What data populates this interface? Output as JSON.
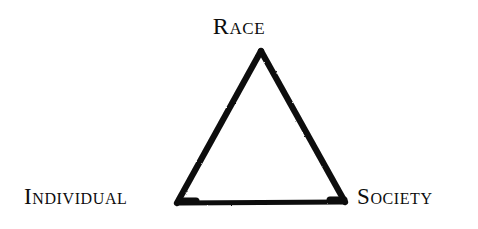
{
  "figure": {
    "type": "triangle-relationship-diagram",
    "background_color": "#ffffff",
    "stroke_color": "#0d0d0d",
    "width": 478,
    "height": 229
  },
  "diagram": {
    "shape": "triangle",
    "vertices": [
      {
        "id": "apex",
        "label": "Race",
        "x": 261,
        "y": 51
      },
      {
        "id": "bottom-left",
        "label": "Individual",
        "x": 177,
        "y": 203
      },
      {
        "id": "bottom-right",
        "label": "Society",
        "x": 345,
        "y": 202
      }
    ],
    "edges": [
      {
        "from": "apex",
        "to": "bottom-right"
      },
      {
        "from": "bottom-right",
        "to": "bottom-left"
      },
      {
        "from": "bottom-left",
        "to": "apex"
      }
    ]
  },
  "labels": {
    "apex": "Race",
    "bottom_left": "Individual",
    "bottom_right": "Society"
  }
}
